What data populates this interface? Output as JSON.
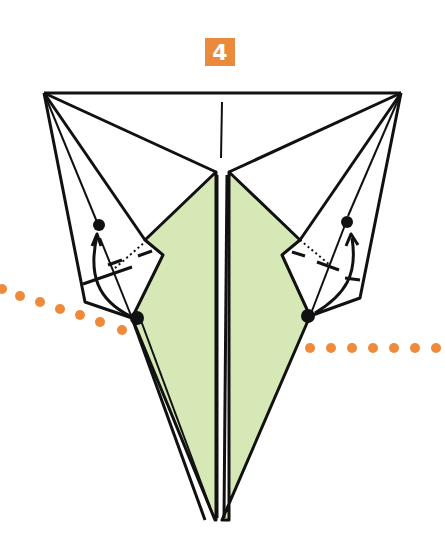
{
  "step": {
    "number": "4"
  },
  "colors": {
    "badge": "#ea8a3c",
    "paper_colored": "#d6e8b6",
    "line": "#111111",
    "dots": "#ef8a3a"
  },
  "diagram": {
    "arrows": [
      "left-fold-up-arrow",
      "right-fold-up-arrow"
    ],
    "reference_points": 4,
    "dotted_guide_lines": 2
  }
}
